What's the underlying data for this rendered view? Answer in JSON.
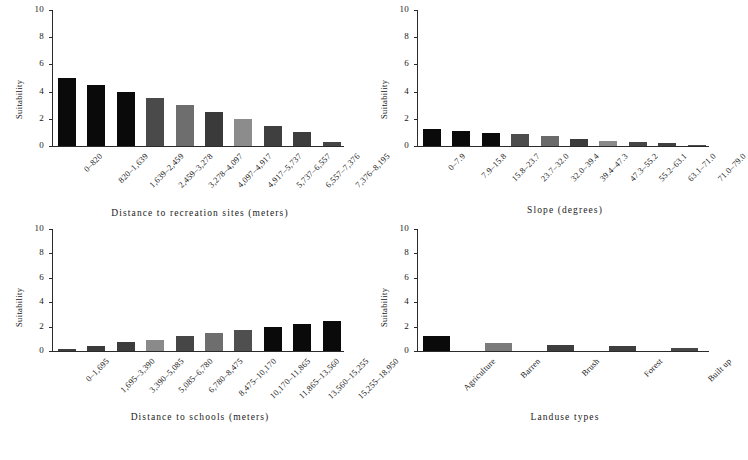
{
  "figure": {
    "y_axis_label": "Suitability",
    "y_ticks": [
      "0",
      "2",
      "4",
      "6",
      "8",
      "10"
    ],
    "ylim": [
      0,
      10
    ]
  },
  "chart_data": [
    {
      "id": "recreation",
      "type": "bar",
      "title": "",
      "xlabel": "Distance to recreation sites (meters)",
      "ylabel": "Suitability",
      "ylim": [
        0,
        10
      ],
      "yticks": [
        0,
        2,
        4,
        6,
        8,
        10
      ],
      "grid": false,
      "legend": "none",
      "categories": [
        "0–820",
        "820–1,639",
        "1,639–2,459",
        "2,459–3,278",
        "3,278–4,097",
        "4,097–4,917",
        "4,917–5,737",
        "5,737–6,557",
        "6,557–7,376",
        "7,376–8,195"
      ],
      "values": [
        5.0,
        4.5,
        4.0,
        3.5,
        3.0,
        2.5,
        2.0,
        1.5,
        1.0,
        0.3
      ],
      "bar_colors": [
        "#0a0a0a",
        "#0a0a0a",
        "#0a0a0a",
        "#4a4a4a",
        "#6e6e6e",
        "#3a3a3a",
        "#8c8c8c",
        "#3f3f3f",
        "#3d3d3d",
        "#454545"
      ]
    },
    {
      "id": "slope",
      "type": "bar",
      "title": "",
      "xlabel": "Slope (degrees)",
      "ylabel": "Suitability",
      "ylim": [
        0,
        10
      ],
      "yticks": [
        0,
        2,
        4,
        6,
        8,
        10
      ],
      "grid": false,
      "legend": "none",
      "categories": [
        "0–7.9",
        "7.9–15.8",
        "15.8–23.7",
        "23.7–32.0",
        "32.0–39.4",
        "39.4–47.3",
        "47.3–55.2",
        "55.2–63.1",
        "63.1–71.0",
        "71.0–79.0"
      ],
      "values": [
        1.25,
        1.1,
        0.95,
        0.85,
        0.7,
        0.55,
        0.4,
        0.3,
        0.2,
        0.1
      ],
      "bar_colors": [
        "#0a0a0a",
        "#0a0a0a",
        "#0a0a0a",
        "#4d4d4d",
        "#6a6a6a",
        "#3c3c3c",
        "#8a8a8a",
        "#454545",
        "#404040",
        "#4a4a4a"
      ]
    },
    {
      "id": "schools",
      "type": "bar",
      "title": "",
      "xlabel": "Distance to schools (meters)",
      "ylabel": "Suitability",
      "ylim": [
        0,
        10
      ],
      "yticks": [
        0,
        2,
        4,
        6,
        8,
        10
      ],
      "grid": false,
      "legend": "none",
      "categories": [
        "0–1,695",
        "1,695–3,390",
        "3,390–5,085",
        "5,085–6,780",
        "6,780–8,475",
        "8,475–10,170",
        "10,170–11,865",
        "11,865–13,560",
        "13,560–15,255",
        "15,255–18,950"
      ],
      "values": [
        0.2,
        0.4,
        0.7,
        0.9,
        1.2,
        1.5,
        1.75,
        2.0,
        2.25,
        2.5
      ],
      "bar_colors": [
        "#3e3e3e",
        "#3a3a3a",
        "#3c3c3c",
        "#8a8a8a",
        "#464646",
        "#6e6e6e",
        "#4f4f4f",
        "#0a0a0a",
        "#0a0a0a",
        "#0a0a0a"
      ]
    },
    {
      "id": "landuse",
      "type": "bar",
      "title": "",
      "xlabel": "Landuse types",
      "ylabel": "Suitability",
      "ylim": [
        0,
        10
      ],
      "yticks": [
        0,
        2,
        4,
        6,
        8,
        10
      ],
      "grid": false,
      "legend": "none",
      "categories": [
        "Agriculture",
        "Barren",
        "Brush",
        "Forest",
        "Built up"
      ],
      "values": [
        1.2,
        0.65,
        0.5,
        0.45,
        0.25
      ],
      "bar_colors": [
        "#0a0a0a",
        "#7b7b7b",
        "#3e3e3e",
        "#3e3e3e",
        "#474747"
      ]
    }
  ]
}
